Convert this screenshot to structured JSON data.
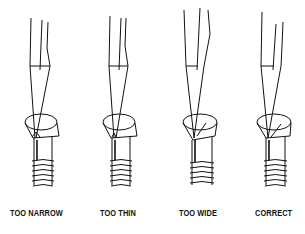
{
  "diagram": {
    "panels": [
      {
        "label": "TOO NARROW",
        "icon": "screwdriver-in-screw-icon"
      },
      {
        "label": "TOO THIN",
        "icon": "screwdriver-in-screw-icon"
      },
      {
        "label": "TOO WIDE",
        "icon": "screwdriver-in-screw-icon"
      },
      {
        "label": "CORRECT",
        "icon": "screwdriver-in-screw-icon"
      }
    ],
    "colors": {
      "line": "#111111",
      "background": "#ffffff"
    }
  }
}
